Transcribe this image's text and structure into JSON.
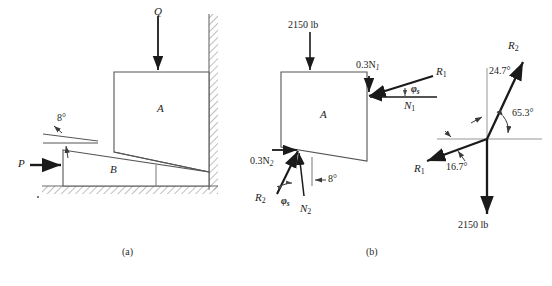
{
  "figure": {
    "background": "#ffffff",
    "ink": "#1a1a1a",
    "line_color": "#4a4a4a"
  },
  "panel_a": {
    "caption": "(a)",
    "block_a_label": "A",
    "block_b_label": "B",
    "load_label": "Q",
    "force_label": "P",
    "angle_label": "8°"
  },
  "panel_b": {
    "caption": "(b)",
    "block_a_label": "A",
    "top_load": "2150 lb",
    "friction_top": "0.3N",
    "friction_top_sub": "1",
    "normal_top": "N",
    "normal_top_sub": "1",
    "resultant_top": "R",
    "resultant_top_sub": "1",
    "phi_top": "φ",
    "phi_top_sub": "s",
    "friction_bottom": "0.3N",
    "friction_bottom_sub": "2",
    "normal_bottom": "N",
    "normal_bottom_sub": "2",
    "resultant_bottom": "R",
    "resultant_bottom_sub": "2",
    "phi_bottom": "φ",
    "phi_bottom_sub": "s",
    "wedge_angle": "8°"
  },
  "force_triangle": {
    "r2_label": "R",
    "r2_sub": "2",
    "r1_label": "R",
    "r1_sub": "1",
    "angle_upper": "24.7°",
    "angle_right": "65.3°",
    "angle_lower": "16.7°",
    "weight_label": "2150 lb"
  }
}
